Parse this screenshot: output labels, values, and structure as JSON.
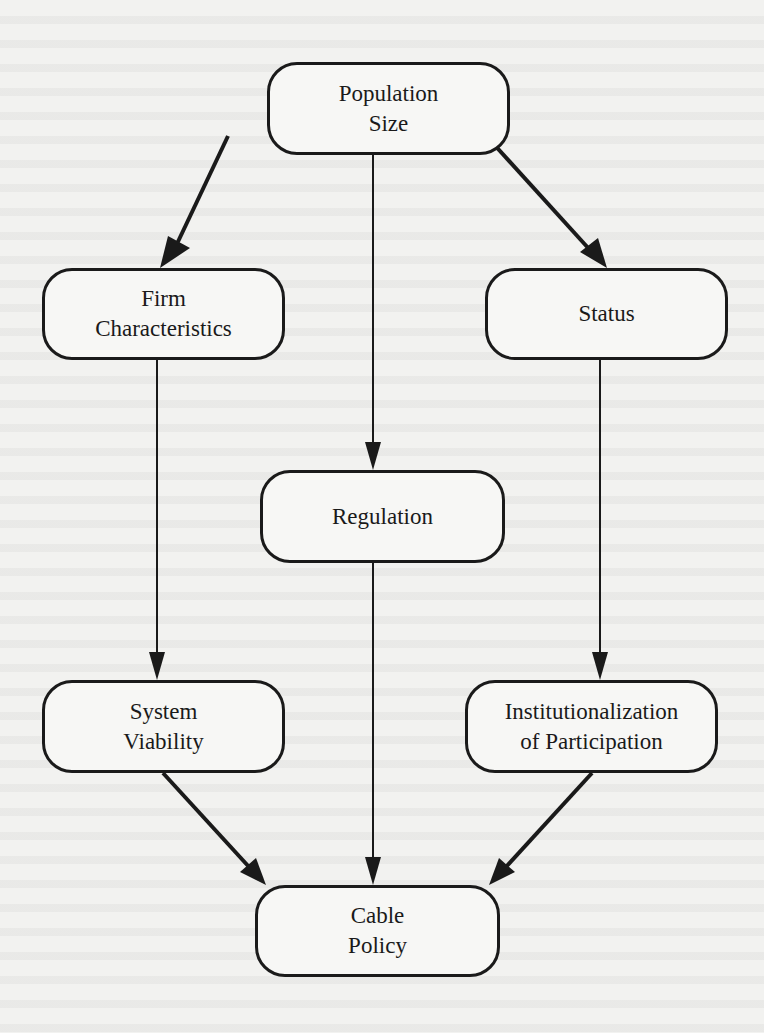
{
  "diagram": {
    "type": "flowchart",
    "nodes": [
      {
        "id": "population_size",
        "lines": [
          "Population",
          "Size"
        ]
      },
      {
        "id": "firm_characteristics",
        "lines": [
          "Firm",
          "Characteristics"
        ]
      },
      {
        "id": "status",
        "lines": [
          "Status"
        ]
      },
      {
        "id": "regulation",
        "lines": [
          "Regulation"
        ]
      },
      {
        "id": "system_viability",
        "lines": [
          "System",
          "Viability"
        ]
      },
      {
        "id": "institutionalization",
        "lines": [
          "Institutionalization",
          "of Participation"
        ]
      },
      {
        "id": "cable_policy",
        "lines": [
          "Cable",
          "Policy"
        ]
      }
    ],
    "edges": [
      {
        "from": "population_size",
        "to": "firm_characteristics"
      },
      {
        "from": "population_size",
        "to": "regulation"
      },
      {
        "from": "population_size",
        "to": "status"
      },
      {
        "from": "firm_characteristics",
        "to": "system_viability"
      },
      {
        "from": "status",
        "to": "institutionalization"
      },
      {
        "from": "system_viability",
        "to": "cable_policy"
      },
      {
        "from": "regulation",
        "to": "cable_policy"
      },
      {
        "from": "institutionalization",
        "to": "cable_policy"
      }
    ],
    "colors": {
      "line": "#1a1a1a",
      "background": "#f2f2f0"
    }
  }
}
